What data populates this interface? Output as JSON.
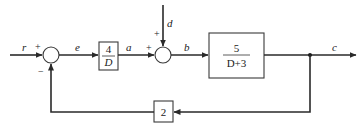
{
  "diagram": {
    "type": "feedback-control-block-diagram",
    "signals": {
      "input": "r",
      "error": "e",
      "controller_output": "a",
      "disturbance": "d",
      "plant_input": "b",
      "output": "c"
    },
    "summing_junction_1": {
      "signs": {
        "r": "+",
        "feedback": "−"
      }
    },
    "summing_junction_2": {
      "signs": {
        "a": "+",
        "d": "+"
      }
    },
    "blocks": {
      "controller": {
        "numerator": "4",
        "denominator": "D"
      },
      "plant": {
        "numerator": "5",
        "denominator": "D+3"
      },
      "feedback": {
        "gain": "2"
      }
    }
  }
}
